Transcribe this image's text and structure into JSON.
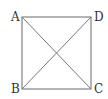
{
  "diagram": {
    "type": "square-with-diagonals",
    "vertices": [
      {
        "label": "A",
        "x": 22,
        "y": 17
      },
      {
        "label": "D",
        "x": 91,
        "y": 17
      },
      {
        "label": "C",
        "x": 91,
        "y": 89
      },
      {
        "label": "B",
        "x": 22,
        "y": 89
      }
    ],
    "edges": [
      [
        "A",
        "D"
      ],
      [
        "D",
        "C"
      ],
      [
        "C",
        "B"
      ],
      [
        "B",
        "A"
      ]
    ],
    "diagonals": [
      [
        "A",
        "C"
      ],
      [
        "B",
        "D"
      ]
    ],
    "line_color": "#6a6a6a",
    "label_color": "#333333"
  }
}
